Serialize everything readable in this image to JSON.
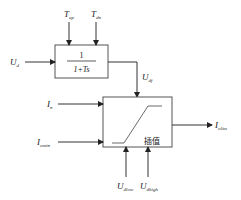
{
  "diagram": {
    "type": "block-diagram",
    "filter_block": {
      "numerator": "1",
      "denominator": "1+Ts",
      "inputs_top": [
        {
          "symbol": "T",
          "subscript": "up"
        },
        {
          "symbol": "T",
          "subscript": "dn"
        }
      ],
      "input_left": {
        "symbol": "U",
        "subscript": "d"
      },
      "output": {
        "symbol": "U",
        "subscript": "df"
      }
    },
    "interp_block": {
      "label": "插值",
      "inputs_left": [
        {
          "symbol": "I",
          "subscript": "n"
        },
        {
          "symbol": "I",
          "subscript": "omin"
        }
      ],
      "inputs_bottom": [
        {
          "symbol": "U",
          "subscript": "dlow"
        },
        {
          "symbol": "U",
          "subscript": "dhigh"
        }
      ],
      "output": {
        "symbol": "I",
        "subscript": "olim"
      }
    },
    "colors": {
      "line": "#333333",
      "background": "#ffffff"
    }
  }
}
